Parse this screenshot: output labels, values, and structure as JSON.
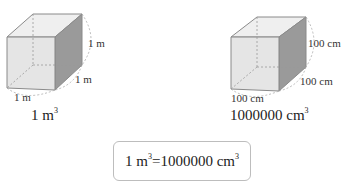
{
  "left_cube": {
    "height_label": "1 m",
    "depth_label": "1 m",
    "width_label": "1 m",
    "volume_number": "1 m",
    "volume_exponent": "3"
  },
  "right_cube": {
    "height_label": "100 cm",
    "depth_label": "100 cm",
    "width_label": "100 cm",
    "volume_number": "1000000 cm",
    "volume_exponent": "3"
  },
  "equation": {
    "left": "1 m",
    "left_exp": "3",
    "right": "=1000000 cm",
    "right_exp": "3"
  },
  "colors": {
    "front_face": "#e2e2e2",
    "top_face": "#efefef",
    "side_face": "#9a9a9a",
    "edge": "#8a8a8a",
    "dashed": "#9a9a9a",
    "box_border": "#bdbdbd"
  }
}
